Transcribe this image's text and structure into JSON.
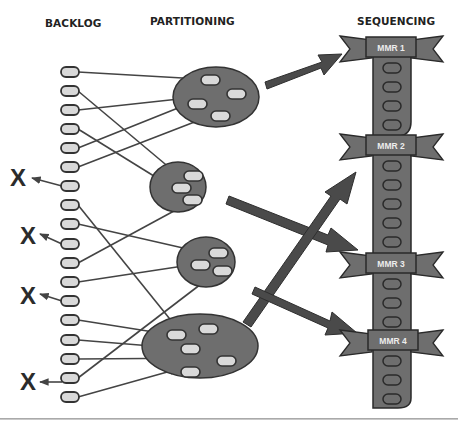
{
  "headers": {
    "backlog": "BACKLOG",
    "partitioning": "PARTITIONING",
    "sequencing": "SEQUENCING"
  },
  "discard_mark": "X",
  "discarded_count": 4,
  "backlog_item_count": 18,
  "partitions": [
    {
      "id": "partition-1",
      "item_count": 4
    },
    {
      "id": "partition-2",
      "item_count": 3
    },
    {
      "id": "partition-3",
      "item_count": 3
    },
    {
      "id": "partition-4",
      "item_count": 4
    }
  ],
  "sequencing": {
    "releases": [
      {
        "label": "MMR 1"
      },
      {
        "label": "MMR 2"
      },
      {
        "label": "MMR 3"
      },
      {
        "label": "MMR 4"
      }
    ]
  },
  "colors": {
    "container_fill": "#6e6e6e",
    "item_fill": "#d9d9d9",
    "outline": "#333333",
    "arrow": "#444444"
  }
}
